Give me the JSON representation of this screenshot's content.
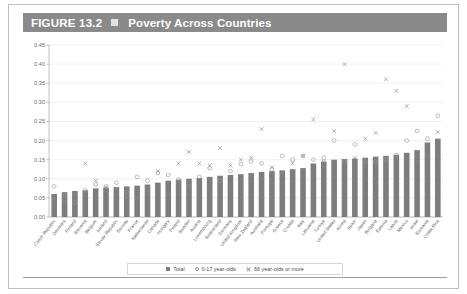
{
  "figure": {
    "number_label": "FIGURE 13.2",
    "square_icon": "filled-square-icon",
    "title": "Poverty Across Countries"
  },
  "legend": {
    "position": "bottom-center",
    "items": [
      {
        "marker": "filled-square",
        "label": "Total"
      },
      {
        "marker": "open-circle",
        "label": "0-17 year-olds"
      },
      {
        "marker": "cross-x",
        "label": "66 year-olds or more"
      }
    ]
  },
  "colors": {
    "header_bg": "#8a8a8a",
    "header_text": "#ffffff",
    "bar": "#7d7d7d",
    "marker_circle": "#9a9a9a",
    "marker_x": "#8c8c8c",
    "grid": "#e3e3e3",
    "card_border": "#bdbdbd"
  },
  "chart_data": {
    "type": "bar",
    "title": "Poverty Across Countries",
    "xlabel": "",
    "ylabel": "",
    "ylim": [
      0.0,
      0.45
    ],
    "ytick_labels": [
      "0.00",
      "0.05",
      "0.10",
      "0.15",
      "0.20",
      "0.25",
      "0.30",
      "0.35",
      "0.40",
      "0.45"
    ],
    "ytick_values": [
      0.0,
      0.05,
      0.1,
      0.15,
      0.2,
      0.25,
      0.3,
      0.35,
      0.4,
      0.45
    ],
    "grid": true,
    "categories": [
      "Czech Republic",
      "Denmark",
      "Finland",
      "Slovenia",
      "Belgium",
      "Iceland",
      "Slovak Republic",
      "Norway",
      "France",
      "Netherlands",
      "Canada",
      "Hungary",
      "Poland",
      "Sweden",
      "Austria",
      "Luxembourg",
      "Switzerland",
      "Germany",
      "United Kingdom",
      "New Zealand",
      "Australia",
      "Portugal",
      "Greece",
      "Croatia",
      "Italy",
      "Lithuania",
      "Türkiye",
      "United States",
      "Korea",
      "Spain",
      "Japan",
      "Bulgaria",
      "Estonia",
      "Latvia",
      "Mexico",
      "Israel",
      "Romania",
      "Costa Rica"
    ],
    "series": [
      {
        "name": "Total",
        "marker": "bar",
        "values": [
          0.06,
          0.065,
          0.068,
          0.07,
          0.075,
          0.077,
          0.078,
          0.08,
          0.082,
          0.085,
          0.09,
          0.095,
          0.098,
          0.1,
          0.102,
          0.105,
          0.108,
          0.11,
          0.112,
          0.115,
          0.118,
          0.12,
          0.122,
          0.125,
          0.128,
          0.14,
          0.145,
          0.15,
          0.152,
          0.153,
          0.155,
          0.158,
          0.16,
          0.163,
          0.168,
          0.175,
          0.195,
          0.205
        ]
      },
      {
        "name": "0-17 year-olds",
        "marker": "open-circle",
        "values": [
          0.08,
          0.055,
          0.038,
          0.07,
          0.085,
          0.08,
          0.09,
          0.065,
          0.105,
          0.095,
          0.115,
          0.11,
          0.098,
          0.08,
          0.105,
          0.128,
          0.095,
          0.12,
          0.138,
          0.145,
          0.14,
          0.125,
          0.16,
          0.15,
          0.16,
          0.15,
          0.155,
          0.2,
          0.145,
          0.19,
          0.145,
          0.145,
          0.15,
          0.162,
          0.2,
          0.225,
          0.205,
          0.265
        ]
      },
      {
        "name": "66 year-olds or more",
        "marker": "cross-x",
        "values": [
          0.048,
          0.04,
          0.06,
          0.14,
          0.095,
          0.078,
          0.075,
          0.05,
          0.05,
          0.07,
          0.12,
          0.06,
          0.14,
          0.17,
          0.14,
          0.135,
          0.18,
          0.135,
          0.15,
          0.155,
          0.23,
          0.13,
          0.115,
          0.14,
          0.16,
          0.255,
          0.145,
          0.225,
          0.4,
          0.155,
          0.205,
          0.22,
          0.36,
          0.33,
          0.29,
          0.145,
          0.16,
          0.222
        ]
      }
    ]
  }
}
